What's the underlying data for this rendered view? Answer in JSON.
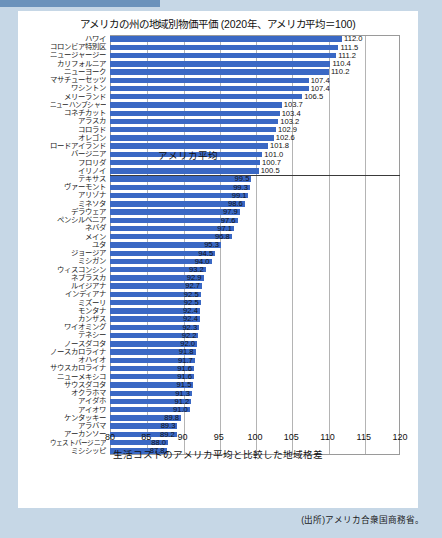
{
  "page": {
    "background_color": "#c6d7e6",
    "card_color": "#ffffff",
    "source_note": "(出所)アメリカ合衆国商務省。"
  },
  "chart_data": {
    "type": "bar",
    "orientation": "horizontal",
    "title": "アメリカの州の地域別物価平価 (2020年、アメリカ平均＝100)",
    "xlabel": "生活コストのアメリカ平均と比較した地域格差",
    "ylabel": "",
    "xlim": [
      80,
      120
    ],
    "xticks": [
      80,
      85,
      90,
      95,
      100,
      105,
      110,
      115,
      120
    ],
    "grid": true,
    "grid_axis": "x",
    "legend": false,
    "bar_color": "#3a68c4",
    "annotations": [
      {
        "text": "アメリカ平均",
        "value": 100,
        "type": "reference-line",
        "line_color": "#3a3a3a"
      }
    ],
    "categories": [
      "ハワイ",
      "コロンビア特別区",
      "ニュージャージー",
      "カリフォルニア",
      "ニューヨーク",
      "マサチューセッツ",
      "ワシントン",
      "メリーランド",
      "ニューハンプシャー",
      "コネチカット",
      "アラスカ",
      "コロラド",
      "オレゴン",
      "ロードアイランド",
      "バージニア",
      "フロリダ",
      "イリノイ",
      "テキサス",
      "ヴァーモント",
      "アリゾナ",
      "ミネソタ",
      "デラウェア",
      "ペンシルベニア",
      "ネバダ",
      "メイン",
      "ユタ",
      "ジョージア",
      "ミシガン",
      "ウィスコンシン",
      "ネブラスカ",
      "ルイジアナ",
      "インディアナ",
      "ミズーリ",
      "モンタナ",
      "カンザス",
      "ワイオミング",
      "テネシー",
      "ノースダコタ",
      "ノースカロライナ",
      "オハイオ",
      "サウスカロライナ",
      "ニューメキシコ",
      "サウスダコタ",
      "オクラホマ",
      "アイダホ",
      "アイオワ",
      "ケンタッキー",
      "アラバマ",
      "アーカンソー",
      "ウェストバージニア",
      "ミシシッピ"
    ],
    "values": [
      112.0,
      111.5,
      111.2,
      110.4,
      110.2,
      107.4,
      107.4,
      106.5,
      103.7,
      103.4,
      103.2,
      102.9,
      102.6,
      101.8,
      101.0,
      100.7,
      100.5,
      99.5,
      99.3,
      99.1,
      98.6,
      97.9,
      97.6,
      97.1,
      96.8,
      95.3,
      94.5,
      94.0,
      93.2,
      92.9,
      92.7,
      92.5,
      92.5,
      92.4,
      92.4,
      92.3,
      92.2,
      92.0,
      91.8,
      91.7,
      91.6,
      91.6,
      91.5,
      91.3,
      91.2,
      91.0,
      89.8,
      89.3,
      89.2,
      88.0,
      87.8
    ]
  }
}
